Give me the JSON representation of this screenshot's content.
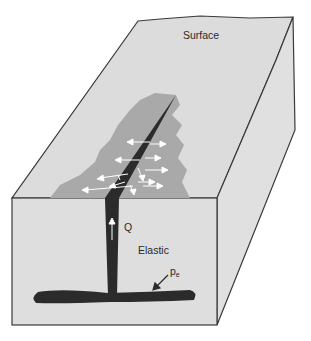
{
  "figure": {
    "type": "block-diagram",
    "labels": {
      "surface": "Surface",
      "flux": "Q",
      "elastic": "Elastic",
      "pressure_symbol": "p",
      "pressure_subscript": "e"
    },
    "colors": {
      "block_fill": "#dedede",
      "outline": "#3a3a3a",
      "magma": "#2b2b2b",
      "intrusion_halo": "#a8a8a8",
      "arrow": "#ffffff"
    }
  }
}
